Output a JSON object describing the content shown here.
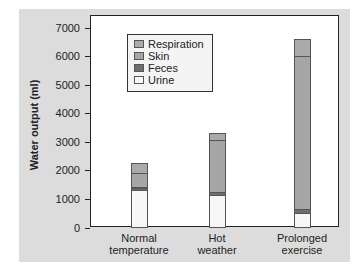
{
  "chart_data": {
    "type": "bar",
    "stacked": true,
    "title": "",
    "xlabel": "",
    "ylabel": "Water output (ml)",
    "ylim": [
      0,
      7000
    ],
    "yticks": [
      0,
      1000,
      2000,
      3000,
      4000,
      5000,
      6000,
      7000
    ],
    "categories": [
      "Normal temperature",
      "Hot weather",
      "Prolonged exercise"
    ],
    "series": [
      {
        "name": "Urine",
        "color": "#f7f7f7",
        "values": [
          1300,
          1150,
          500
        ]
      },
      {
        "name": "Feces",
        "color": "#6e6e6e",
        "values": [
          100,
          100,
          150
        ]
      },
      {
        "name": "Skin",
        "color": "#a6a6a6",
        "values": [
          500,
          1800,
          5350
        ]
      },
      {
        "name": "Respiration",
        "color": "#aaaaaa",
        "values": [
          350,
          250,
          600
        ]
      }
    ],
    "totals": [
      2250,
      3300,
      6600
    ],
    "legend": {
      "position": "upper-left inside plot",
      "entries": [
        "Respiration",
        "Skin",
        "Feces",
        "Urine"
      ]
    },
    "grid": false
  },
  "labels": {
    "ylabel": "Water output (ml)",
    "x": [
      "Normal\ntemperature",
      "Hot\nweather",
      "Prolonged\nexercise"
    ],
    "ticks": [
      "0",
      "1000",
      "2000",
      "3000",
      "4000",
      "5000",
      "6000",
      "7000"
    ],
    "legend": [
      "Respiration",
      "Skin",
      "Feces",
      "Urine"
    ]
  }
}
